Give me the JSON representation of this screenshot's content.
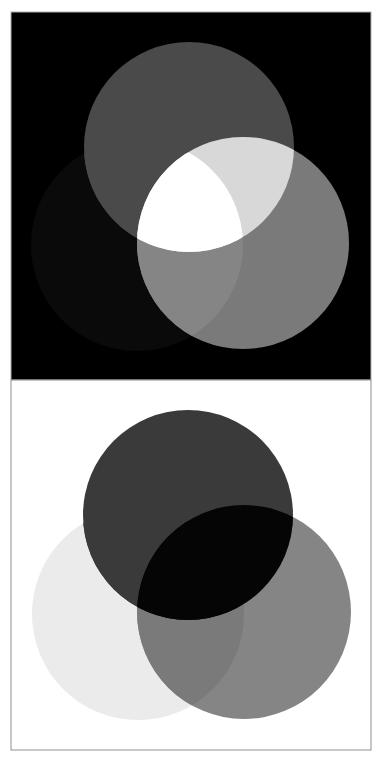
{
  "diagram": {
    "type": "color-mixing-venn",
    "panels": [
      {
        "id": "additive",
        "frame": {
          "x": 11,
          "y": 12,
          "width": 360,
          "height": 368,
          "background": "#000000",
          "border": "#b0b0b0"
        },
        "circles": [
          {
            "id": "A",
            "cx": 189,
            "cy": 147,
            "r": 105,
            "fill": "#4a4a4a"
          },
          {
            "id": "B",
            "cx": 243,
            "cy": 243,
            "r": 106,
            "fill": "#7a7a7a"
          },
          {
            "id": "C",
            "cx": 137,
            "cy": 245,
            "r": 106,
            "fill": "#0a0a0a"
          }
        ],
        "overlaps": {
          "A_B": "#d8d8d8",
          "A_C": "#4a4a4a",
          "B_C": "#858585",
          "A_B_C": "#ffffff"
        }
      },
      {
        "id": "subtractive",
        "frame": {
          "x": 11,
          "y": 380,
          "width": 360,
          "height": 370,
          "background": "#ffffff",
          "border": "#909090"
        },
        "circles": [
          {
            "id": "A",
            "cx": 188,
            "cy": 515,
            "r": 105,
            "fill": "#3a3a3a"
          },
          {
            "id": "B",
            "cx": 244,
            "cy": 612,
            "r": 107,
            "fill": "#858585"
          },
          {
            "id": "C",
            "cx": 138,
            "cy": 614,
            "r": 106,
            "fill": "#ebebeb"
          }
        ],
        "overlaps": {
          "A_B": "#050505",
          "A_C": "#3a3a3a",
          "B_C": "#7a7a7a",
          "A_B_C": "#050505"
        }
      }
    ]
  }
}
